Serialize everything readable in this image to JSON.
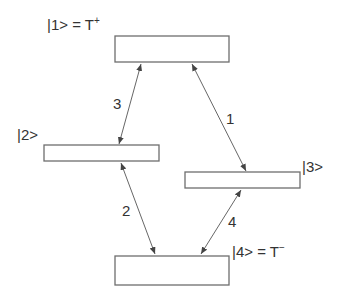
{
  "diagram": {
    "type": "energy-level transition diagram",
    "states": [
      {
        "id": 1,
        "label": "|1> = T",
        "superscript": "+",
        "box": {
          "x": 115,
          "y": 36,
          "w": 114,
          "h": 26
        }
      },
      {
        "id": 2,
        "label": "|2>",
        "superscript": "",
        "box": {
          "x": 44,
          "y": 145,
          "w": 115,
          "h": 16
        }
      },
      {
        "id": 3,
        "label": "|3>",
        "superscript": "",
        "box": {
          "x": 185,
          "y": 172,
          "w": 115,
          "h": 16
        }
      },
      {
        "id": 4,
        "label": "|4> = T",
        "superscript": "−",
        "box": {
          "x": 115,
          "y": 256,
          "w": 114,
          "h": 29
        }
      }
    ],
    "transitions": [
      {
        "label": "1",
        "from_state": 1,
        "to_state": 3,
        "bidirectional": true
      },
      {
        "label": "2",
        "from_state": 2,
        "to_state": 4,
        "bidirectional": true
      },
      {
        "label": "3",
        "from_state": 1,
        "to_state": 2,
        "bidirectional": true
      },
      {
        "label": "4",
        "from_state": 3,
        "to_state": 4,
        "bidirectional": true
      }
    ],
    "colors": {
      "box_stroke": "#6e6e6e",
      "line": "#555555",
      "text": "#333333",
      "background": "#ffffff"
    }
  }
}
